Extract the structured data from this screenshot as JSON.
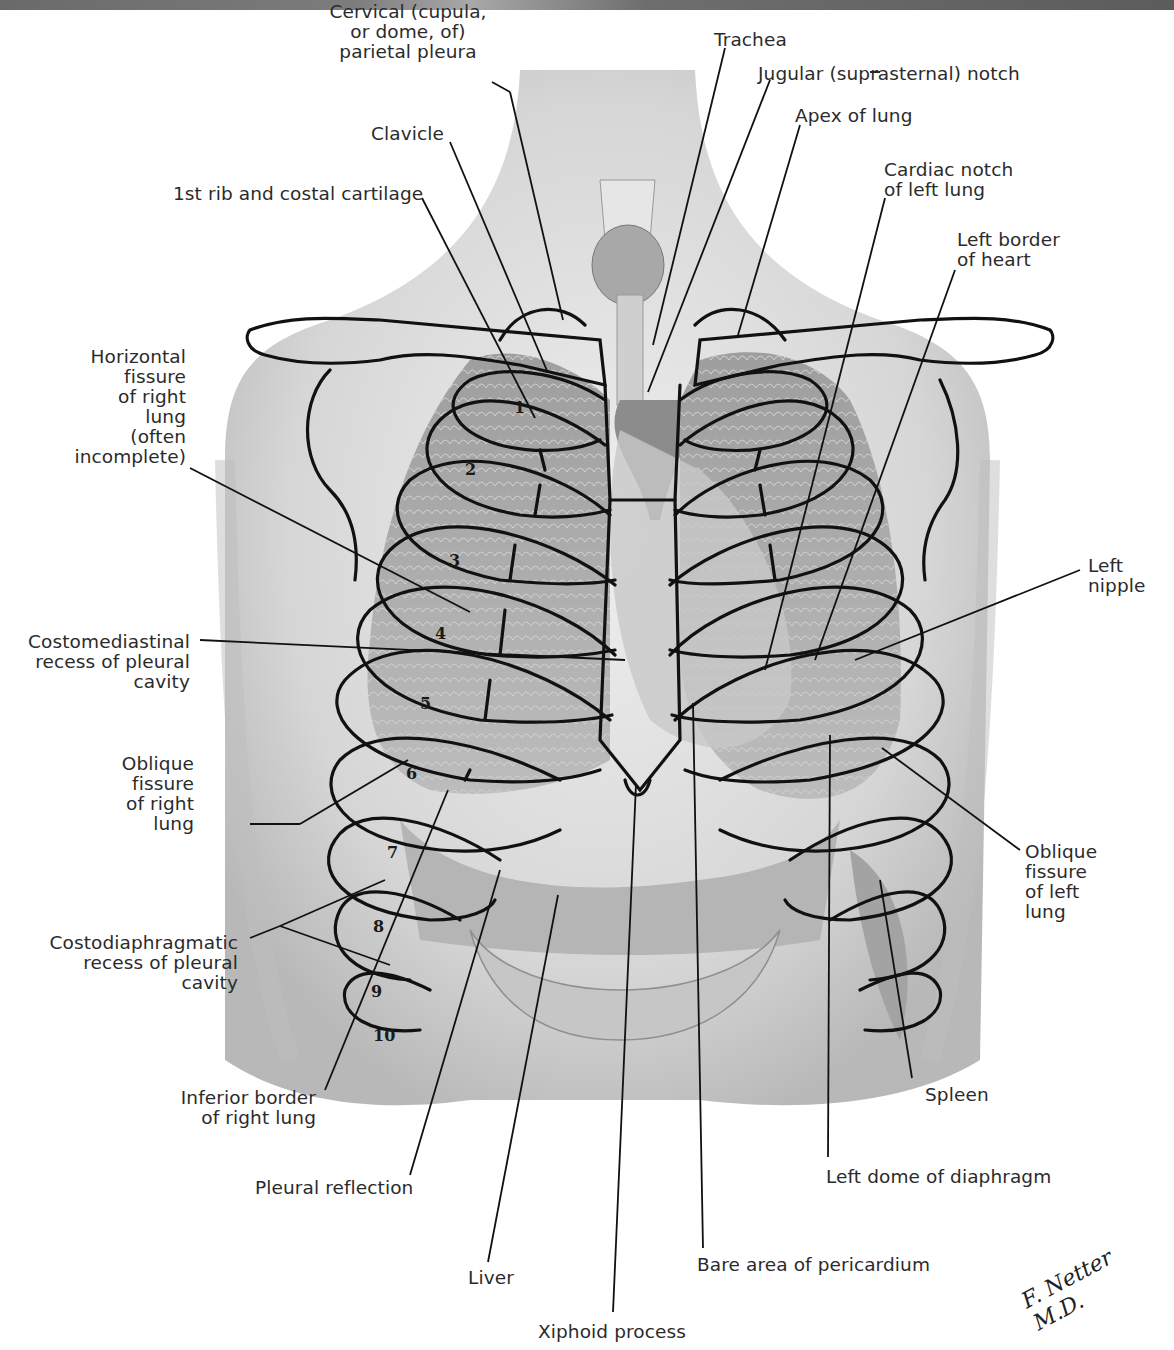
{
  "figure": {
    "signature": "F. Netter M.D.",
    "colors": {
      "background": "#ffffff",
      "outline": "#111111",
      "label_text": "#2b2b2b",
      "skin": "#d9d9d9",
      "lung": "#a9a9a9"
    }
  },
  "labels": {
    "cervical_pleura": "Cervical (cupula,\nor dome, of)\nparietal pleura",
    "trachea": "Trachea",
    "jugular_notch": "Jugular (suprasternal) notch",
    "apex_of_lung": "Apex of lung",
    "clavicle": "Clavicle",
    "cardiac_notch": "Cardiac notch\nof left lung",
    "first_rib": "1st rib and costal cartilage",
    "left_border_heart": "Left border\nof heart",
    "horizontal_fissure": "Horizontal\nfissure\nof right\nlung\n(often\nincomplete)",
    "left_nipple": "Left\nnipple",
    "costomediastinal_recess": "Costomediastinal\nrecess of pleural\ncavity",
    "oblique_fissure_right": "Oblique\nfissure\nof right\nlung",
    "oblique_fissure_left": "Oblique\nfissure\nof left\nlung",
    "costodiaphragmatic_recess": "Costodiaphragmatic\nrecess of pleural\ncavity",
    "inferior_border_right_lung": "Inferior border\nof right lung",
    "spleen": "Spleen",
    "pleural_reflection": "Pleural reflection",
    "left_dome_diaphragm": "Left dome of diaphragm",
    "liver": "Liver",
    "bare_area_pericardium": "Bare area of pericardium",
    "xiphoid_process": "Xiphoid process"
  },
  "rib_numbers": [
    "1",
    "2",
    "3",
    "4",
    "5",
    "6",
    "7",
    "8",
    "9",
    "10"
  ]
}
